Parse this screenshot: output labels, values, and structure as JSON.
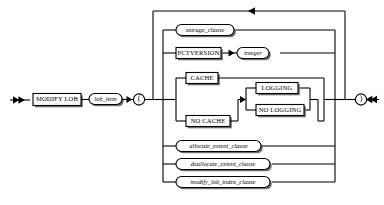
{
  "diagram": {
    "type": "railroad-syntax-diagram",
    "title": "MODIFY LOB",
    "background_color": "#ffffff",
    "line_color": "#000000",
    "shadow_color": "#6f6f6f",
    "start_terminator": "double-arrow-right",
    "end_terminator": "double-arrow-left",
    "loopback_arrow": "arrow-left",
    "nodes": {
      "modify_lob": {
        "label": "MODIFY LOB",
        "shape": "rect"
      },
      "lob_item": {
        "label": "lob_item",
        "shape": "oval"
      },
      "open_paren": {
        "label": "(",
        "shape": "circle"
      },
      "close_paren": {
        "label": ")",
        "shape": "circle"
      },
      "storage_clause": {
        "label": "storage_clause",
        "shape": "oval"
      },
      "pctversion": {
        "label": "PCTVERSION",
        "shape": "rect"
      },
      "integer": {
        "label": "integer",
        "shape": "oval"
      },
      "cache": {
        "label": "CACHE",
        "shape": "rect"
      },
      "no_cache": {
        "label": "NO CACHE",
        "shape": "rect"
      },
      "logging": {
        "label": "LOGGING",
        "shape": "rect"
      },
      "no_logging": {
        "label": "NO LOGGING",
        "shape": "rect"
      },
      "allocate_extent_clause": {
        "label": "allocate_extent_clause",
        "shape": "oval"
      },
      "deallocate_extent_clause": {
        "label": "deallocate_extent_clause",
        "shape": "oval"
      },
      "modify_lob_index_clause": {
        "label": "modify_lob_index_clause",
        "shape": "oval"
      }
    },
    "branch_order": [
      "storage_clause",
      "pctversion",
      "cache_group",
      "allocate_extent_clause",
      "deallocate_extent_clause",
      "modify_lob_index_clause"
    ]
  }
}
